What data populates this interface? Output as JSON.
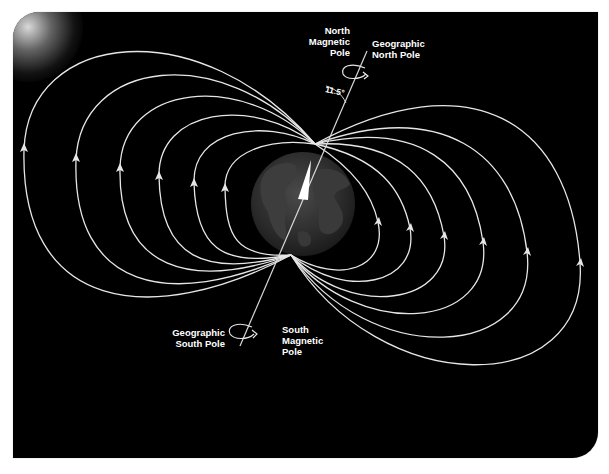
{
  "diagram": {
    "labels": {
      "north_magnetic_pole": [
        "North",
        "Magnetic",
        "Pole"
      ],
      "geographic_north_pole": [
        "Geographic",
        "North Pole"
      ],
      "angle": "11.5°",
      "geographic_south_pole": [
        "Geographic",
        "South Pole"
      ],
      "south_magnetic_pole": [
        "South",
        "Magnetic",
        "Pole"
      ]
    },
    "colors": {
      "background": "#000000",
      "field_line": "#e6e6e6",
      "text": "#ffffff",
      "globe": "#2a2a2a",
      "needle": "#ffffff"
    },
    "field_lines": {
      "left_count": 6,
      "right_count": 6,
      "direction": "arrows point upward toward north magnetic pole on left and right"
    },
    "axis_tilt_degrees": 11.5
  }
}
